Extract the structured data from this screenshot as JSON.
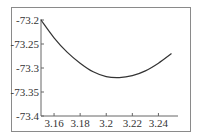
{
  "chart_data": {
    "type": "line",
    "title": "",
    "xlabel": "",
    "ylabel": "",
    "xlim": [
      3.15,
      3.255
    ],
    "ylim": [
      -73.4,
      -73.2
    ],
    "grid": false,
    "legend": null,
    "x_ticks": [
      "3.16",
      "3.18",
      "3.2",
      "3.22",
      "3.24"
    ],
    "y_ticks": [
      "-73.2",
      "-73.25",
      "-73.3",
      "-73.35",
      "-73.4"
    ],
    "series": [
      {
        "name": "curve",
        "color": "#333333",
        "x": [
          3.15,
          3.16,
          3.17,
          3.18,
          3.19,
          3.2,
          3.21,
          3.22,
          3.23,
          3.24,
          3.25
        ],
        "y": [
          -73.2,
          -73.237,
          -73.267,
          -73.29,
          -73.308,
          -73.318,
          -73.32,
          -73.316,
          -73.306,
          -73.29,
          -73.27
        ]
      }
    ]
  },
  "colors": {
    "axis": "#666666",
    "frame": "#8a8a8a",
    "line": "#333333",
    "text": "#333333"
  }
}
